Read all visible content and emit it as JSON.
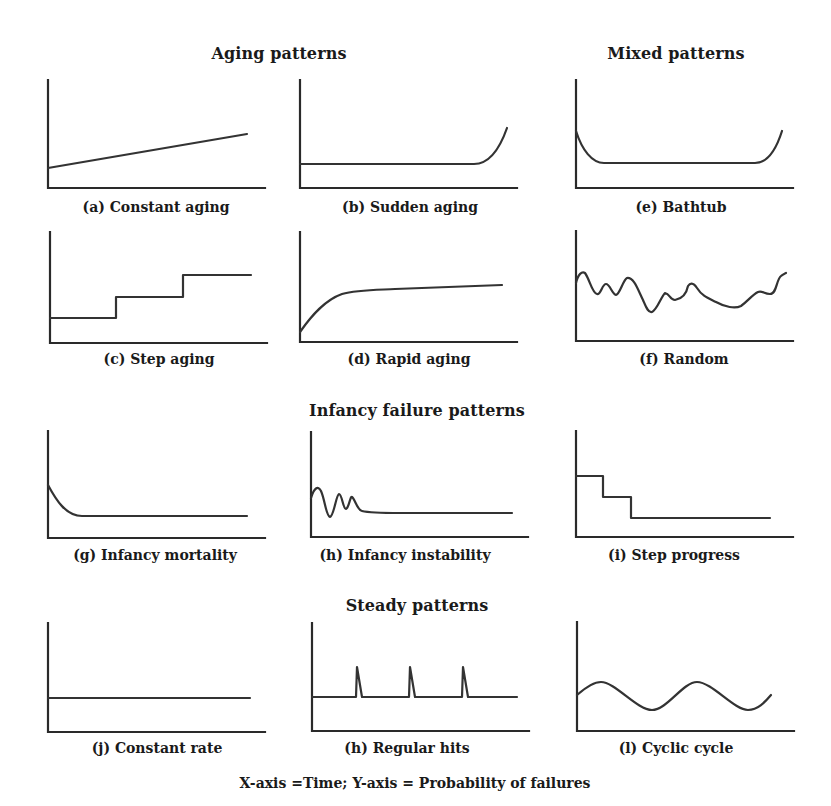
{
  "section_titles": {
    "aging": "Aging patterns",
    "mixed": "Mixed patterns",
    "infancy": "Infancy failure patterns",
    "steady": "Steady patterns"
  },
  "panels": [
    {
      "id": "a",
      "caption": "(a) Constant aging",
      "group": "aging",
      "shape": "linear increasing"
    },
    {
      "id": "b",
      "caption": "(b) Sudden aging",
      "group": "aging",
      "shape": "flat then sharp rise"
    },
    {
      "id": "e",
      "caption": "(e) Bathtub",
      "group": "mixed",
      "shape": "decrease, flat, increase"
    },
    {
      "id": "c",
      "caption": "(c) Step aging",
      "group": "aging",
      "shape": "increasing steps"
    },
    {
      "id": "d",
      "caption": "(d) Rapid aging",
      "group": "aging",
      "shape": "rapid rise then plateau"
    },
    {
      "id": "f",
      "caption": "(f) Random",
      "group": "mixed",
      "shape": "irregular fluctuation"
    },
    {
      "id": "g",
      "caption": "(g) Infancy mortality",
      "group": "infancy",
      "shape": "decay then flat"
    },
    {
      "id": "h",
      "caption": "(h) Infancy instability",
      "group": "infancy",
      "shape": "damped oscillation then flat"
    },
    {
      "id": "i",
      "caption": "(i) Step progress",
      "group": "infancy",
      "shape": "decreasing steps"
    },
    {
      "id": "j",
      "caption": "(j) Constant rate",
      "group": "steady",
      "shape": "flat"
    },
    {
      "id": "h2",
      "caption": "(h) Regular hits",
      "group": "steady",
      "shape": "flat with periodic spikes"
    },
    {
      "id": "l",
      "caption": "(l) Cyclic cycle",
      "group": "steady",
      "shape": "sinusoidal"
    }
  ],
  "footer": "X-axis =Time; Y-axis = Probability of failures",
  "axes": {
    "x": "Time",
    "y": "Probability of failures"
  },
  "colors": {
    "line": "#333333",
    "background": "#ffffff"
  }
}
